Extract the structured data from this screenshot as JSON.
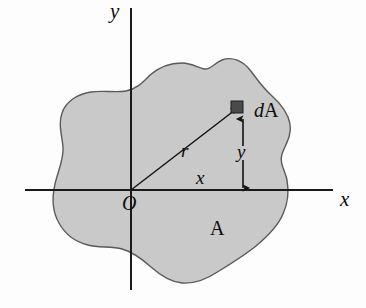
{
  "figure": {
    "background_color": "#fdfdfd",
    "region_fill_color": "#c9c9c9",
    "region_stroke_color": "#5a5a5a",
    "axis_color": "#1a1a1a",
    "marker_color": "#4a4a4a",
    "labels": {
      "y_axis": "y",
      "x_axis": "x",
      "origin": "O",
      "radius": "r",
      "x_distance": "x",
      "y_distance": "y",
      "area_element_d": "d",
      "area_element_A": "A",
      "region": "A"
    },
    "geometry": {
      "origin_px": [
        131,
        190
      ],
      "x_axis_span_px": [
        25,
        333
      ],
      "y_axis_span_px": [
        8,
        290
      ],
      "dA_marker_px": [
        236,
        106
      ],
      "dA_marker_size_px": 11,
      "radius_line_from_px": [
        131,
        190
      ],
      "radius_line_to_px": [
        234,
        110
      ],
      "y_dimension_line_x_px": 243,
      "y_dimension_from_y_px": 117,
      "y_dimension_to_y_px": 190
    }
  }
}
